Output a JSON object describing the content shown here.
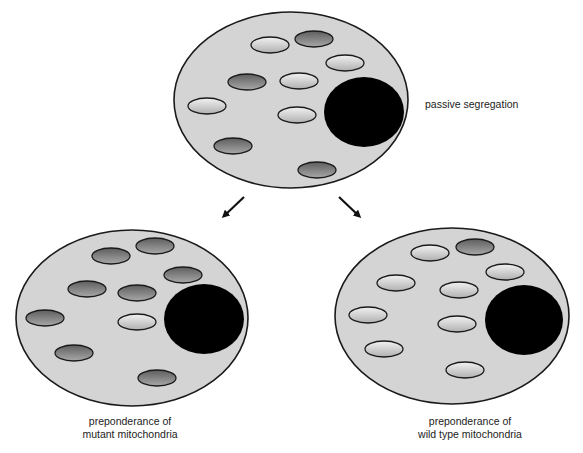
{
  "diagram": {
    "labels": {
      "top": "passive segregation",
      "left_line1": "preponderance of",
      "left_line2": "mutant mitochondria",
      "right_line1": "preponderance of",
      "right_line2": "wild type mitochondria"
    },
    "colors": {
      "cytoplasm": "#d4d4d4",
      "outline": "#1a1a1a",
      "nucleus": "#000000",
      "mutant_mito": "#7d7d7d",
      "wildtype_mito": "#e6e6e6"
    },
    "cells": [
      {
        "id": "parent-cell",
        "cx": 291,
        "cy": 100,
        "rx": 117,
        "ry": 88,
        "nucleus": {
          "cx": 364,
          "cy": 112,
          "rx": 40,
          "ry": 35
        },
        "mitochondria": [
          {
            "cx": 270,
            "cy": 45,
            "type": "wild"
          },
          {
            "cx": 314,
            "cy": 39,
            "type": "mutant"
          },
          {
            "cx": 345,
            "cy": 63,
            "type": "wild"
          },
          {
            "cx": 247,
            "cy": 82,
            "type": "mutant"
          },
          {
            "cx": 299,
            "cy": 81,
            "type": "wild"
          },
          {
            "cx": 207,
            "cy": 106,
            "type": "wild"
          },
          {
            "cx": 297,
            "cy": 115,
            "type": "wild"
          },
          {
            "cx": 233,
            "cy": 146,
            "type": "mutant"
          },
          {
            "cx": 317,
            "cy": 170,
            "type": "mutant"
          }
        ]
      },
      {
        "id": "mutant-daughter-cell",
        "cx": 132,
        "cy": 318,
        "rx": 116,
        "ry": 88,
        "nucleus": {
          "cx": 204,
          "cy": 319,
          "rx": 40,
          "ry": 35
        },
        "mitochondria": [
          {
            "cx": 111,
            "cy": 256,
            "type": "mutant"
          },
          {
            "cx": 155,
            "cy": 246,
            "type": "mutant"
          },
          {
            "cx": 183,
            "cy": 275,
            "type": "mutant"
          },
          {
            "cx": 87,
            "cy": 289,
            "type": "mutant"
          },
          {
            "cx": 137,
            "cy": 293,
            "type": "mutant"
          },
          {
            "cx": 45,
            "cy": 318,
            "type": "mutant"
          },
          {
            "cx": 137,
            "cy": 322,
            "type": "wild"
          },
          {
            "cx": 74,
            "cy": 353,
            "type": "mutant"
          },
          {
            "cx": 157,
            "cy": 378,
            "type": "mutant"
          }
        ]
      },
      {
        "id": "wildtype-daughter-cell",
        "cx": 452,
        "cy": 316,
        "rx": 117,
        "ry": 88,
        "nucleus": {
          "cx": 524,
          "cy": 320,
          "rx": 39,
          "ry": 35
        },
        "mitochondria": [
          {
            "cx": 430,
            "cy": 253,
            "type": "wild"
          },
          {
            "cx": 475,
            "cy": 247,
            "type": "mutant"
          },
          {
            "cx": 505,
            "cy": 272,
            "type": "wild"
          },
          {
            "cx": 396,
            "cy": 283,
            "type": "wild"
          },
          {
            "cx": 459,
            "cy": 290,
            "type": "wild"
          },
          {
            "cx": 368,
            "cy": 315,
            "type": "wild"
          },
          {
            "cx": 457,
            "cy": 324,
            "type": "wild"
          },
          {
            "cx": 384,
            "cy": 349,
            "type": "wild"
          },
          {
            "cx": 465,
            "cy": 370,
            "type": "wild"
          }
        ]
      }
    ],
    "arrows": [
      {
        "id": "arrow-to-mutant",
        "x1": 244,
        "y1": 197,
        "x2": 224,
        "y2": 216
      },
      {
        "id": "arrow-to-wildtype",
        "x1": 339,
        "y1": 197,
        "x2": 359,
        "y2": 216
      }
    ]
  }
}
